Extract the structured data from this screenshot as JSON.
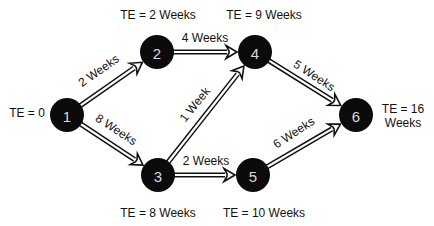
{
  "diagram": {
    "type": "PERT network",
    "nodes": [
      {
        "id": "1",
        "label": "1",
        "x": 67,
        "y": 115,
        "te": "TE = 0",
        "te_x": 27,
        "te_y": 117
      },
      {
        "id": "2",
        "label": "2",
        "x": 157,
        "y": 52,
        "te": "TE = 2 Weeks",
        "te_x": 158,
        "te_y": 19
      },
      {
        "id": "3",
        "label": "3",
        "x": 158,
        "y": 175,
        "te": "TE = 8 Weeks",
        "te_x": 158,
        "te_y": 217
      },
      {
        "id": "4",
        "label": "4",
        "x": 255,
        "y": 52,
        "te": "TE = 9 Weeks",
        "te_x": 264,
        "te_y": 19
      },
      {
        "id": "5",
        "label": "5",
        "x": 253,
        "y": 175,
        "te": "TE = 10 Weeks",
        "te_x": 264,
        "te_y": 217
      },
      {
        "id": "6",
        "label": "6",
        "x": 356,
        "y": 115,
        "te": "TE = 16",
        "te_x": 403,
        "te_y": 113,
        "te_line2": "Weeks",
        "te2_y": 127
      }
    ],
    "edges": [
      {
        "from": "1",
        "to": "2",
        "label": "2 Weeks",
        "lx": 101,
        "ly": 74,
        "angle": -35
      },
      {
        "from": "1",
        "to": "3",
        "label": "8 Weeks",
        "lx": 114,
        "ly": 133,
        "angle": 33
      },
      {
        "from": "2",
        "to": "4",
        "label": "4 Weeks",
        "lx": 205,
        "ly": 42,
        "angle": 0
      },
      {
        "from": "3",
        "to": "4",
        "label": "1 Week",
        "lx": 198,
        "ly": 107,
        "angle": -51
      },
      {
        "from": "3",
        "to": "5",
        "label": "2 Weeks",
        "lx": 206,
        "ly": 165,
        "angle": 0
      },
      {
        "from": "4",
        "to": "6",
        "label": "5 Weeks",
        "lx": 312,
        "ly": 79,
        "angle": 33
      },
      {
        "from": "5",
        "to": "6",
        "label": "6 Weeks",
        "lx": 296,
        "ly": 136,
        "angle": -33
      }
    ]
  }
}
